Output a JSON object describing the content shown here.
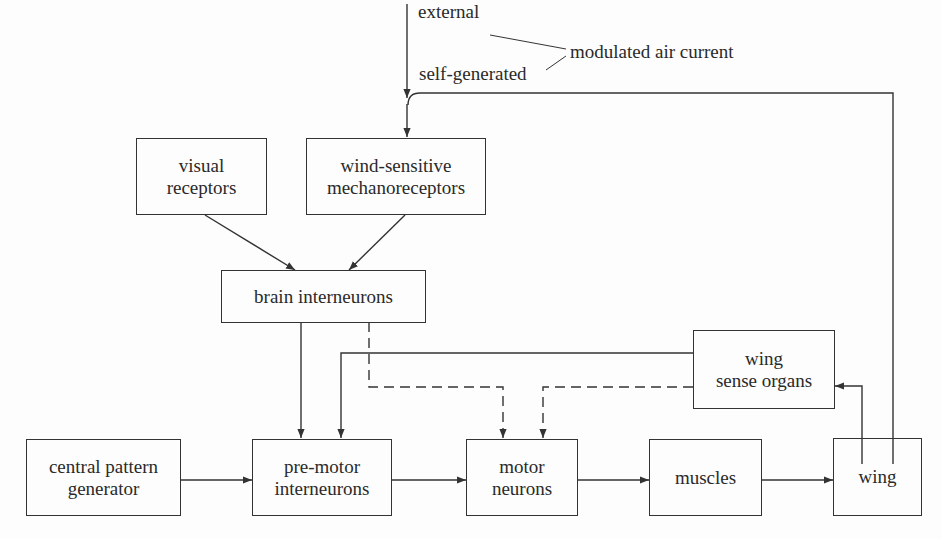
{
  "diagram": {
    "type": "block-diagram",
    "inputs": {
      "external_label": "external",
      "self_generated_label": "self-generated",
      "modulated_label": "modulated air current"
    },
    "nodes": {
      "visual_receptors": {
        "line1": "visual",
        "line2": "receptors"
      },
      "wind_sensitive": {
        "line1": "wind-sensitive",
        "line2": "mechanoreceptors"
      },
      "brain_interneurons": {
        "label": "brain interneurons"
      },
      "wing_sense_organs": {
        "line1": "wing",
        "line2": "sense organs"
      },
      "central_pattern_generator": {
        "line1": "central pattern",
        "line2": "generator"
      },
      "pre_motor_interneurons": {
        "line1": "pre-motor",
        "line2": "interneurons"
      },
      "motor_neurons": {
        "line1": "motor",
        "line2": "neurons"
      },
      "muscles": {
        "label": "muscles"
      },
      "wing": {
        "label": "wing"
      }
    },
    "edges": [
      {
        "from": "external air current",
        "to": "wind-sensitive mechanoreceptors",
        "style": "solid"
      },
      {
        "from": "wing",
        "to": "wind-sensitive mechanoreceptors",
        "style": "solid",
        "note": "self-generated"
      },
      {
        "from": "visual receptors",
        "to": "brain interneurons",
        "style": "solid"
      },
      {
        "from": "wind-sensitive mechanoreceptors",
        "to": "brain interneurons",
        "style": "solid"
      },
      {
        "from": "brain interneurons",
        "to": "pre-motor interneurons",
        "style": "solid"
      },
      {
        "from": "brain interneurons",
        "to": "motor neurons",
        "style": "dashed"
      },
      {
        "from": "wing sense organs",
        "to": "pre-motor interneurons",
        "style": "solid"
      },
      {
        "from": "wing sense organs",
        "to": "motor neurons",
        "style": "dashed"
      },
      {
        "from": "central pattern generator",
        "to": "pre-motor interneurons",
        "style": "solid"
      },
      {
        "from": "pre-motor interneurons",
        "to": "motor neurons",
        "style": "solid"
      },
      {
        "from": "motor neurons",
        "to": "muscles",
        "style": "solid"
      },
      {
        "from": "muscles",
        "to": "wing",
        "style": "solid"
      },
      {
        "from": "wing",
        "to": "wing sense organs",
        "style": "solid"
      }
    ]
  }
}
